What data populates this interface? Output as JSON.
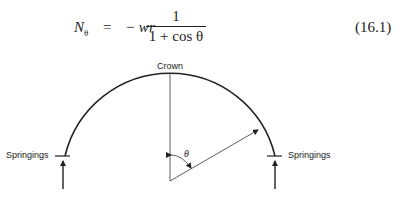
{
  "equation": {
    "lhs_symbol": "N",
    "lhs_subscript": "θ",
    "equals": "=",
    "coefficient": "− wr",
    "numerator": "1",
    "denominator": "1 + cos θ",
    "number": "(16.1)"
  },
  "diagram": {
    "labels": {
      "crown": "Crown",
      "springings_left": "Springings",
      "springings_right": "Springings",
      "angle": "θ"
    },
    "colors": {
      "stroke": "#222222",
      "background": "#ffffff"
    }
  }
}
